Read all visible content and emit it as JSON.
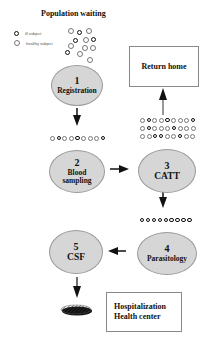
{
  "title": "Population waiting",
  "legend": [
    {
      "label": "ill subject",
      "type": "ill"
    },
    {
      "label": "healthy subject",
      "type": "healthy"
    }
  ],
  "steps": [
    {
      "number": "1",
      "label": "Registration"
    },
    {
      "number": "2",
      "label": "Blood sampling"
    },
    {
      "number": "3",
      "label": "CATT"
    },
    {
      "number": "4",
      "label": "Parasitology"
    },
    {
      "number": "5",
      "label": "CSF"
    }
  ],
  "boxes": {
    "return_home": "Return home",
    "hospitalization_line1": "Hospitalization",
    "hospitalization_line2": "Health center"
  },
  "queues": {
    "after_registration": "healthy,ill,healthy,healthy,ill,healthy,healthy,healthy,ill",
    "after_catt_row1": "healthy,ill,healthy,healthy,ill,healthy,healthy,healthy,ill",
    "after_catt_row2": "healthy,ill,healthy,healthy,healthy,ill,healthy,healthy,healthy",
    "after_catt_row3": "healthy,healthy,ill,ill,healthy,healthy,ill,healthy,healthy",
    "after_parasitology": "ill,ill,ill,ill,ill,ill,ill,ill,ill"
  },
  "colors": {
    "ellipse_fill": "#d6d6d6",
    "arrow": "#111111",
    "box_border": "#888888"
  }
}
